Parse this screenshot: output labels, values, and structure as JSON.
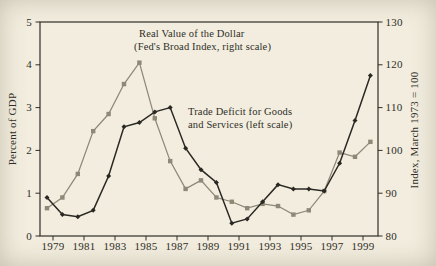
{
  "page": {
    "background_color": "#f0ebdb",
    "ink_color": "#2f2d28"
  },
  "chart_data": {
    "type": "line",
    "x": [
      1979,
      1980,
      1981,
      1982,
      1983,
      1984,
      1985,
      1986,
      1987,
      1988,
      1989,
      1990,
      1991,
      1992,
      1993,
      1994,
      1995,
      1996,
      1997,
      1998,
      1999,
      2000
    ],
    "x_tick_labels": [
      "1979",
      "1981",
      "1983",
      "1985",
      "1987",
      "1989",
      "1991",
      "1993",
      "1995",
      "1997",
      "1999"
    ],
    "series": [
      {
        "name": "Real Value of the Dollar (Fed's Broad Index, right scale)",
        "axis": "right",
        "marker": "square",
        "color": "#8d8878",
        "values": [
          86.5,
          89,
          94.5,
          104.5,
          108.5,
          115.5,
          120.5,
          107.5,
          97.5,
          91,
          93,
          89,
          88,
          86.5,
          87.5,
          87,
          85,
          86,
          90.5,
          99.5,
          98.5,
          102
        ]
      },
      {
        "name": "Trade Deficit for Goods and Services (left scale)",
        "axis": "left",
        "marker": "diamond",
        "color": "#2a2823",
        "values": [
          0.9,
          0.5,
          0.45,
          0.6,
          1.4,
          2.55,
          2.65,
          2.9,
          3.0,
          2.05,
          1.55,
          1.25,
          0.3,
          0.4,
          0.8,
          1.2,
          1.1,
          1.1,
          1.05,
          1.7,
          2.7,
          3.75
        ]
      }
    ],
    "left_axis": {
      "label": "Percent of GDP",
      "min": 0,
      "max": 5,
      "ticks": [
        0,
        1,
        2,
        3,
        4,
        5
      ]
    },
    "right_axis": {
      "label": "Index, March 1973 = 100",
      "min": 80,
      "max": 130,
      "ticks": [
        80,
        90,
        100,
        110,
        120,
        130
      ]
    },
    "annotations": [
      {
        "lines": [
          "Real Value of the Dollar",
          "(Fed's Broad Index, right scale)"
        ]
      },
      {
        "lines": [
          "Trade Deficit for Goods",
          "and Services (left scale)"
        ]
      }
    ],
    "grid": false,
    "legend": "none"
  }
}
